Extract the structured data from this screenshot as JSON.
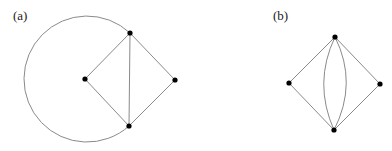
{
  "figure": {
    "panels": [
      {
        "label": "(a)",
        "vertices": [
          {
            "id": "top",
            "x": 130,
            "y": 33
          },
          {
            "id": "left",
            "x": 85,
            "y": 79
          },
          {
            "id": "right",
            "x": 175,
            "y": 80
          },
          {
            "id": "bottom",
            "x": 129,
            "y": 126
          }
        ],
        "edges": [
          {
            "from": "top",
            "to": "left",
            "type": "straight"
          },
          {
            "from": "top",
            "to": "right",
            "type": "straight"
          },
          {
            "from": "left",
            "to": "bottom",
            "type": "straight"
          },
          {
            "from": "right",
            "to": "bottom",
            "type": "straight"
          },
          {
            "from": "top",
            "to": "bottom",
            "type": "straight"
          },
          {
            "from": "top",
            "to": "bottom",
            "type": "large-arc-around-left"
          }
        ]
      },
      {
        "label": "(b)",
        "vertices": [
          {
            "id": "top",
            "x": 335,
            "y": 37
          },
          {
            "id": "left",
            "x": 289,
            "y": 83
          },
          {
            "id": "right",
            "x": 380,
            "y": 84
          },
          {
            "id": "bottom",
            "x": 334,
            "y": 130
          }
        ],
        "edges": [
          {
            "from": "top",
            "to": "left",
            "type": "straight"
          },
          {
            "from": "top",
            "to": "right",
            "type": "straight"
          },
          {
            "from": "left",
            "to": "bottom",
            "type": "straight"
          },
          {
            "from": "right",
            "to": "bottom",
            "type": "straight"
          },
          {
            "from": "top",
            "to": "bottom",
            "type": "curve-left"
          },
          {
            "from": "top",
            "to": "bottom",
            "type": "curve-right"
          }
        ]
      }
    ],
    "colors": {
      "edge": "#8a8a8a",
      "vertex": "#000000"
    }
  }
}
